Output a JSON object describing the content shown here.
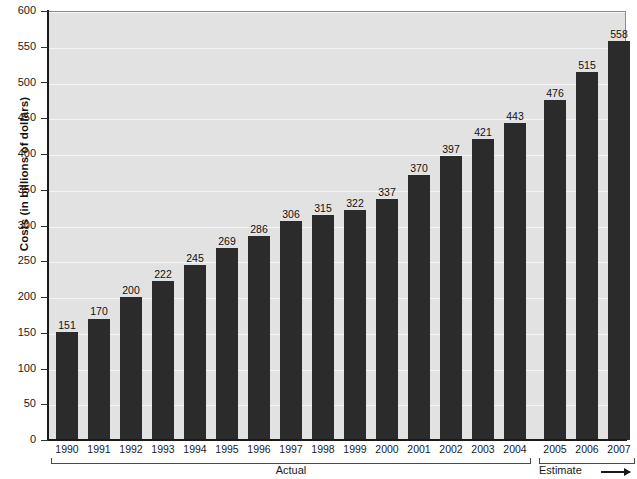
{
  "chart_data": {
    "type": "bar",
    "title": "",
    "xlabel": "",
    "ylabel": "Costs (in billions of dollars)",
    "ylim": [
      0,
      600
    ],
    "ytick_step": 50,
    "yticks": [
      0,
      50,
      100,
      150,
      200,
      250,
      300,
      350,
      400,
      450,
      500,
      550,
      600
    ],
    "grid": true,
    "legend_position": "none",
    "categories": [
      "1990",
      "1991",
      "1992",
      "1993",
      "1994",
      "1995",
      "1996",
      "1997",
      "1998",
      "1999",
      "2000",
      "2001",
      "2002",
      "2003",
      "2004",
      "2005",
      "2006",
      "2007"
    ],
    "values": [
      151,
      170,
      200,
      222,
      245,
      269,
      286,
      306,
      315,
      322,
      337,
      370,
      397,
      421,
      443,
      476,
      515,
      558
    ],
    "data_labels": [
      "151",
      "170",
      "200",
      "222",
      "245",
      "269",
      "286",
      "306",
      "315",
      "322",
      "337",
      "370",
      "397",
      "421",
      "443",
      "476",
      "515",
      "558"
    ],
    "annotations": [
      {
        "name": "actual",
        "label": "Actual",
        "from_category": "1990",
        "to_category": "2004"
      },
      {
        "name": "estimate",
        "label": "Estimate",
        "from_category": "2005",
        "to_category": "2007",
        "arrow": true
      }
    ],
    "colors": {
      "bar": "#2b2b2b",
      "plot_background": "#e2e2e2",
      "gridline": "#f4f4f4",
      "axis": "#1a1a1a",
      "page_background": "#ffffff",
      "text": "#1a1a1a"
    }
  }
}
